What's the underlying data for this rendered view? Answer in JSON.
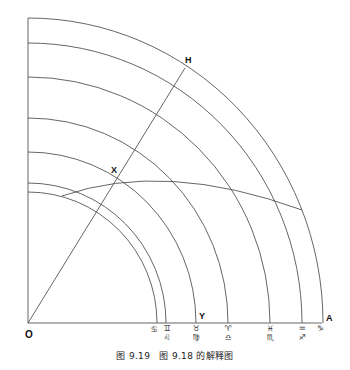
{
  "diagram": {
    "origin": {
      "x": 28,
      "y": 323
    },
    "stroke_color": "#555555",
    "axis_end_x": 322,
    "axis_top_y": 18,
    "arcs": [
      {
        "rx": 295,
        "ry": 305
      },
      {
        "rx": 274,
        "ry": 280
      },
      {
        "rx": 242,
        "ry": 246
      },
      {
        "rx": 200,
        "ry": 205
      },
      {
        "rx": 168,
        "ry": 171
      },
      {
        "rx": 138,
        "ry": 140
      },
      {
        "rx": 129,
        "ry": 131
      }
    ],
    "radial_line": {
      "x1": 28,
      "y1": 323,
      "x2": 185,
      "y2": 68
    },
    "oblique_arc": {
      "start": [
        62,
        196
      ],
      "control": [
        165,
        160
      ],
      "end": [
        302,
        210
      ]
    },
    "point_labels": {
      "O": "O",
      "H": "H",
      "X": "X",
      "Y": "Y",
      "A": "A"
    },
    "zodiac_marks": [
      {
        "x": 156,
        "top": "♋",
        "bottom": ""
      },
      {
        "x": 166,
        "top": "♊",
        "bottom": "♌"
      },
      {
        "x": 196,
        "top": "♉",
        "bottom": "♍"
      },
      {
        "x": 228,
        "top": "♈",
        "bottom": "♎"
      },
      {
        "x": 270,
        "top": "♓",
        "bottom": "♏"
      },
      {
        "x": 302,
        "top": "♒",
        "bottom": "♐"
      },
      {
        "x": 322,
        "top": "♑",
        "bottom": ""
      }
    ]
  },
  "caption": "图 9.19　图 9.18 的解释图"
}
